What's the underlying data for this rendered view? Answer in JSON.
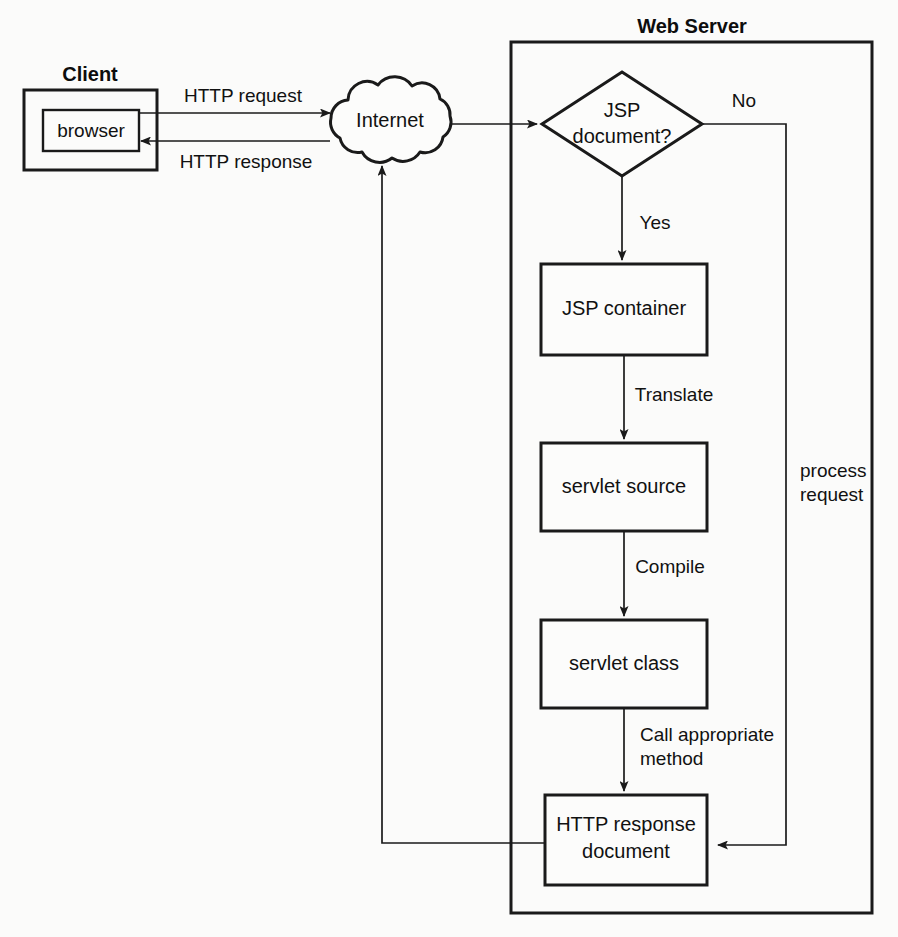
{
  "figure": {
    "type": "flowchart"
  },
  "groups": {
    "client": {
      "title": "Client",
      "node_label": "browser"
    },
    "web_server": {
      "title": "Web Server"
    }
  },
  "network": {
    "cloud_label": "Internet"
  },
  "nodes": {
    "decision": {
      "line1": "JSP",
      "line2": "document?"
    },
    "jsp_container": {
      "label": "JSP container"
    },
    "servlet_source": {
      "label": "servlet source"
    },
    "servlet_class": {
      "label": "servlet class"
    },
    "http_response_document": {
      "line1": "HTTP response",
      "line2": "document"
    }
  },
  "edges": {
    "http_request": "HTTP request",
    "http_response": "HTTP response",
    "decision_yes": "Yes",
    "decision_no": "No",
    "translate": "Translate",
    "compile": "Compile",
    "call_method_line1": "Call appropriate",
    "call_method_line2": "method",
    "process_request_line1": "process",
    "process_request_line2": "request"
  },
  "colors": {
    "ink": "#1a1a1a",
    "paper": "#fbfbfa"
  }
}
